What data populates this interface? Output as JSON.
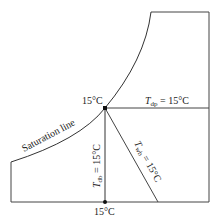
{
  "diagram": {
    "type": "psychrometric-sketch",
    "labels": {
      "saturation_line": "Saturation line",
      "state_point_temp": "15°C",
      "bottom_point_temp": "15°C",
      "dew_point": {
        "symbol": "T",
        "subscript": "dp",
        "value": " = 15°C"
      },
      "dry_bulb": {
        "symbol": "T",
        "subscript": "db",
        "value": " = 15°C"
      },
      "wet_bulb": {
        "symbol": "T",
        "subscript": "wb",
        "value": " = 15°C"
      }
    },
    "colors": {
      "line": "#333333",
      "point": "#111111"
    }
  }
}
